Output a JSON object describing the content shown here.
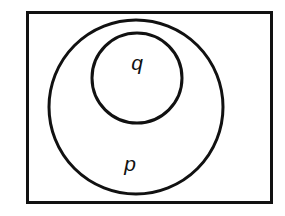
{
  "diagram": {
    "type": "euler-diagram",
    "background_color": "#ffffff",
    "stroke_color": "#111111",
    "fill_color": "#ffffff",
    "universe": {
      "shape": "rectangle",
      "x": 26,
      "y": 11,
      "width": 247,
      "height": 193,
      "stroke_width": 3
    },
    "sets": [
      {
        "id": "p",
        "label": "p",
        "shape": "circle",
        "cx": 136,
        "cy": 107,
        "r": 87,
        "stroke_width": 3,
        "label_x": 130,
        "label_y": 171,
        "label_font_size": 21
      },
      {
        "id": "q",
        "label": "q",
        "shape": "circle",
        "cx": 137,
        "cy": 78,
        "r": 45,
        "stroke_width": 3,
        "label_x": 137,
        "label_y": 70,
        "label_font_size": 21
      }
    ]
  }
}
